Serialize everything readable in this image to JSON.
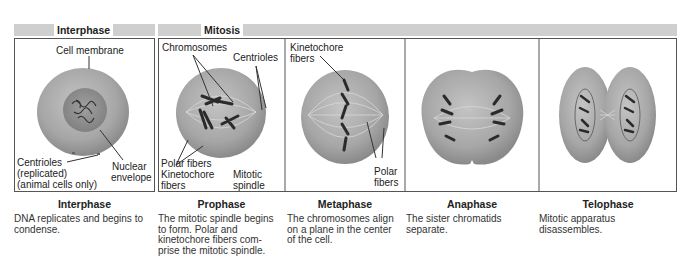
{
  "headers": {
    "interphase": "Interphase",
    "mitosis": "Mitosis"
  },
  "panels": [
    {
      "id": "interphase",
      "title": "Interphase",
      "description": "DNA replicates and begins to condense.",
      "description_lines": [
        "DNA replicates and begins to",
        "condense."
      ],
      "labels": {
        "cell_membrane": "Cell membrane",
        "centrioles_1": "Centrioles",
        "centrioles_2": "(replicated)",
        "centrioles_3": "(animal cells only)",
        "nuclear_1": "Nuclear",
        "nuclear_2": "envelope"
      }
    },
    {
      "id": "prophase",
      "title": "Prophase",
      "description": "The mitotic spindle begins to form. Polar and kinetochore fibers comprise the mitotic spindle.",
      "description_lines": [
        "The mitotic spindle begins",
        "to form. Polar and",
        "kinetochore fibers com-",
        "prise the mitotic spindle."
      ],
      "labels": {
        "chromosomes": "Chromosomes",
        "centrioles": "Centrioles",
        "polar_fibers": "Polar fibers",
        "kinetochore_1": "Kinetochore",
        "kinetochore_2": "fibers",
        "mitotic_1": "Mitotic",
        "mitotic_2": "spindle"
      }
    },
    {
      "id": "metaphase",
      "title": "Metaphase",
      "description": "The chromosomes align on a plane in the center of the cell.",
      "description_lines": [
        "The chromosomes align",
        "on a plane in the center",
        "of the cell."
      ],
      "labels": {
        "kinetochore_1": "Kinetochore",
        "kinetochore_2": "fibers",
        "polar_1": "Polar",
        "polar_2": "fibers"
      }
    },
    {
      "id": "anaphase",
      "title": "Anaphase",
      "description": "The sister chromatids separate.",
      "description_lines": [
        "The sister chromatids",
        "separate."
      ]
    },
    {
      "id": "telophase",
      "title": "Telophase",
      "description": "Mitotic apparatus disassembles.",
      "description_lines": [
        "Mitotic apparatus",
        "disassembles."
      ]
    }
  ],
  "colors": {
    "header_bar": "#cfcfcf",
    "cell_fill": "#a8a8a8",
    "nucleus_fill": "#8f8f8f",
    "chromosome": "#2b2b2b",
    "border": "#555555"
  }
}
